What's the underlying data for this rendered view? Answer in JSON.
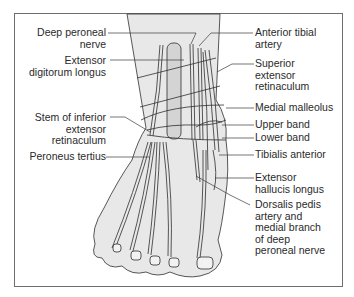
{
  "figure": {
    "colors": {
      "frame": "#6e6e6e",
      "skin_fill": "#e6e6e6",
      "leg_fill": "#e9e9e9",
      "tendon_fill": "#d3d3d3",
      "line": "#2f2f2f",
      "leader": "#3a3a3a",
      "text": "#2a2a2a"
    }
  },
  "labels": {
    "left": [
      {
        "id": "deep-peroneal-nerve",
        "lines": [
          "Deep peroneal",
          "nerve"
        ]
      },
      {
        "id": "extensor-digitorum-longus",
        "lines": [
          "Extensor",
          "digitorum longus"
        ]
      },
      {
        "id": "stem-inferior-extensor-retinaculum",
        "lines": [
          "Stem of inferior",
          "extensor",
          "retinaculum"
        ]
      },
      {
        "id": "peroneus-tertius",
        "lines": [
          "Peroneus tertius"
        ]
      }
    ],
    "right": [
      {
        "id": "anterior-tibial-artery",
        "lines": [
          "Anterior tibial",
          "artery"
        ]
      },
      {
        "id": "superior-extensor-retinaculum",
        "lines": [
          "Superior",
          "extensor",
          "retinaculum"
        ]
      },
      {
        "id": "medial-malleolus",
        "lines": [
          "Medial malleolus"
        ]
      },
      {
        "id": "upper-band",
        "lines": [
          "Upper band"
        ]
      },
      {
        "id": "lower-band",
        "lines": [
          "Lower band"
        ]
      },
      {
        "id": "tibialis-anterior",
        "lines": [
          "Tibialis anterior"
        ]
      },
      {
        "id": "extensor-hallucis-longus",
        "lines": [
          "Extensor",
          "hallucis longus"
        ]
      },
      {
        "id": "dorsalis-pedis",
        "lines": [
          "Dorsalis pedis",
          "artery and",
          "medial branch",
          "of deep",
          "peroneal nerve"
        ]
      }
    ]
  }
}
